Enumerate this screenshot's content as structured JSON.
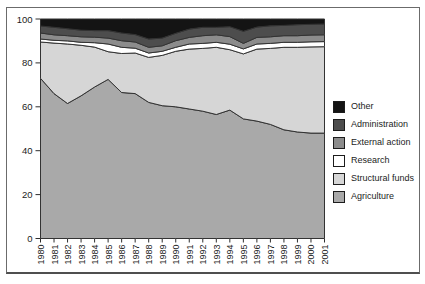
{
  "figure": {
    "background": "#ffffff",
    "frame_border_color": "#6b6b6b",
    "axis_color": "#2e2e2e",
    "outline_color": "#333333"
  },
  "chart_data": {
    "type": "area",
    "stacked": true,
    "unit": "percent",
    "title": "",
    "xlabel": "",
    "ylabel": "",
    "ylim": [
      0,
      100
    ],
    "yticks": [
      "0",
      "20",
      "40",
      "60",
      "80",
      "100"
    ],
    "grid": false,
    "legend_position": "right",
    "legend_order": "top_to_bottom_reverse_of_stack",
    "x": [
      "1980",
      "1981",
      "1982",
      "1983",
      "1984",
      "1985",
      "1986",
      "1987",
      "1988",
      "1989",
      "1990",
      "1991",
      "1992",
      "1993",
      "1994",
      "1995",
      "1996",
      "1997",
      "1998",
      "1999",
      "2000",
      "2001"
    ],
    "series": [
      {
        "name": "Agriculture",
        "color": "#a9a9a9",
        "values": [
          73,
          66,
          61.5,
          65,
          69,
          72.5,
          66.5,
          66,
          62,
          60.5,
          60,
          59,
          58,
          56.5,
          58.5,
          54.5,
          53.5,
          52,
          49.5,
          48.5,
          48,
          48
        ]
      },
      {
        "name": "Structural funds",
        "color": "#d6d6d6",
        "values": [
          16.5,
          23,
          27.1,
          23,
          18.2,
          12.6,
          17.8,
          18.5,
          20.5,
          22.9,
          25.3,
          27.3,
          28.6,
          30.6,
          27.5,
          29.6,
          32.8,
          34.6,
          37.6,
          38.6,
          39.3,
          39.4
        ]
      },
      {
        "name": "Research",
        "color": "#ffffff",
        "values": [
          1.4,
          1.3,
          1.4,
          1.4,
          2.0,
          3.5,
          2.8,
          2.2,
          2.0,
          1.9,
          1.8,
          2.3,
          2.3,
          2.3,
          2.5,
          2.3,
          2.3,
          2.3,
          2.3,
          2.3,
          2.3,
          2.3
        ]
      },
      {
        "name": "External action",
        "color": "#8c8c8c",
        "values": [
          2.7,
          2.5,
          2.4,
          2.5,
          2.5,
          2.7,
          3.0,
          2.8,
          2.6,
          2.5,
          3.0,
          3.0,
          3.5,
          3.4,
          3.5,
          2.5,
          3.0,
          3.0,
          3.0,
          3.0,
          3.1,
          3.1
        ]
      },
      {
        "name": "Administration",
        "color": "#4d4d4d",
        "values": [
          3.2,
          3.4,
          3.2,
          3.0,
          3.0,
          3.4,
          3.5,
          3.4,
          3.8,
          3.5,
          3.4,
          3.8,
          3.8,
          3.4,
          4.5,
          5.5,
          4.7,
          5.0,
          4.7,
          5.0,
          4.9,
          4.9
        ]
      },
      {
        "name": "Other",
        "color": "#141414",
        "values": [
          3.2,
          3.8,
          4.4,
          5.1,
          5.3,
          5.3,
          6.4,
          7.1,
          9.1,
          8.7,
          6.5,
          4.6,
          3.8,
          3.8,
          3.5,
          5.6,
          3.7,
          3.1,
          2.9,
          2.6,
          2.4,
          2.3
        ]
      }
    ]
  }
}
